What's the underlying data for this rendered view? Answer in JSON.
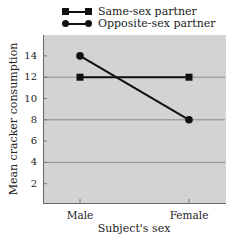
{
  "chart_data": {
    "type": "line",
    "title": "",
    "xlabel": "Subject's sex",
    "ylabel": "Mean cracker consumption",
    "categories": [
      "Male",
      "Female"
    ],
    "series": [
      {
        "name": "Same-sex partner",
        "marker": "square",
        "values": [
          12,
          12
        ]
      },
      {
        "name": "Opposite-sex partner",
        "marker": "circle",
        "values": [
          14,
          8
        ]
      }
    ],
    "ylim": [
      0,
      16
    ],
    "yticks": [
      2,
      4,
      6,
      8,
      10,
      12,
      14
    ],
    "gridlines_y": [
      4,
      8,
      12
    ],
    "legend_position": "top",
    "colors": {
      "plot_background": "#d3d3d3",
      "line": "#111111",
      "grid": "#8a8a8a"
    }
  },
  "legend": {
    "items": [
      {
        "label": "Same-sex partner"
      },
      {
        "label": "Opposite-sex partner"
      }
    ]
  },
  "axes": {
    "x_label": "Subject's sex",
    "y_label": "Mean cracker consumption",
    "x_ticks": [
      "Male",
      "Female"
    ],
    "y_ticks": [
      "2",
      "4",
      "6",
      "8",
      "10",
      "12",
      "14"
    ]
  }
}
